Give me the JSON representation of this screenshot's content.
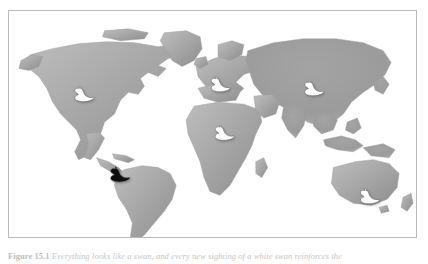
{
  "figure": {
    "caption_label": "Figure 15.1",
    "caption_text": "Everything looks like a swan, and every new sighting of a white swan reinforces the",
    "frame_border_color": "#b9b9b9",
    "background_color": "#ffffff"
  },
  "map": {
    "title": "World map with swan markers",
    "ocean_color": "#ffffff",
    "land_fill_light": "#b6b6b6",
    "land_fill_dark": "#8f8f8f",
    "land_outline_color": "#a0a0a0",
    "continents": [
      "North America",
      "South America",
      "Europe",
      "Africa",
      "Asia",
      "Australia",
      "Greenland",
      "Antarctica"
    ]
  },
  "markers": {
    "white_swan_color": "#ffffff",
    "black_swan_color": "#111111",
    "swan_outline_color": "#5d5d5d",
    "items": [
      {
        "id": "swan-north-america",
        "region": "North America",
        "color": "white",
        "x": 75,
        "y": 85,
        "scale": 1.0,
        "label": "white swan"
      },
      {
        "id": "swan-europe",
        "region": "Europe",
        "color": "white",
        "x": 212,
        "y": 75,
        "scale": 1.0,
        "label": "white swan"
      },
      {
        "id": "swan-asia",
        "region": "Asia",
        "color": "white",
        "x": 306,
        "y": 79,
        "scale": 1.0,
        "label": "white swan"
      },
      {
        "id": "swan-africa",
        "region": "Africa",
        "color": "white",
        "x": 216,
        "y": 124,
        "scale": 1.0,
        "label": "white swan"
      },
      {
        "id": "swan-south-america",
        "region": "South America",
        "color": "black",
        "x": 111,
        "y": 166,
        "scale": 1.0,
        "label": "black swan"
      },
      {
        "id": "swan-australia",
        "region": "Australia",
        "color": "white",
        "x": 362,
        "y": 188,
        "scale": 1.0,
        "label": "white swan"
      }
    ]
  }
}
